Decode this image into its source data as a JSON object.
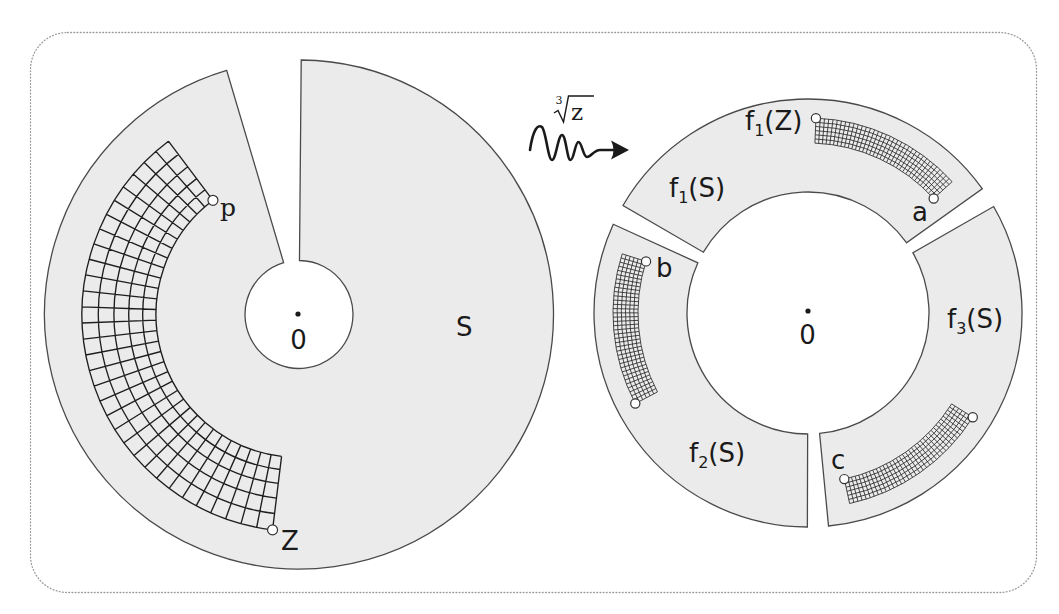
{
  "figure": {
    "mapping_label": {
      "index": "3",
      "radicand": "z"
    },
    "domain": {
      "region_label": "S",
      "origin_label": "0",
      "point_labels": {
        "p": "p",
        "Z": "Z"
      }
    },
    "image": {
      "origin_label": "0",
      "sector_labels": [
        {
          "base": "f",
          "sub": "1",
          "arg": "(S)"
        },
        {
          "base": "f",
          "sub": "2",
          "arg": "(S)"
        },
        {
          "base": "f",
          "sub": "3",
          "arg": "(S)"
        }
      ],
      "f1Z_label": {
        "base": "f",
        "sub": "1",
        "arg": "(Z)"
      },
      "point_labels": {
        "a": "a",
        "b": "b",
        "c": "c"
      }
    }
  },
  "colors": {
    "region_fill": "#ebebeb",
    "region_stroke": "#4a4a4a",
    "grid_stroke": "#1e1e1e",
    "frame_stroke": "#9a9a9a",
    "marker_fill": "#ffffff"
  },
  "diagram": {
    "domain": {
      "center": [
        299,
        314.5
      ],
      "r_outer": 254.5,
      "r_inner": 54,
      "arc_from_deg": 106.5,
      "arc_to_deg": 449.5,
      "grid": {
        "r_inner": 143,
        "r_outer": 217,
        "deg_from": 127,
        "deg_to": 263,
        "radial_cells": 5,
        "angular_cells": 32,
        "radial_spacing": "cubic"
      }
    },
    "image": {
      "center": [
        808,
        313
      ],
      "r_outer": 214,
      "r_inner": 121,
      "branches": [
        {
          "name": "f1",
          "rotation_deg": 0
        },
        {
          "name": "f2",
          "rotation_deg": 120
        },
        {
          "name": "f3",
          "rotation_deg": 240
        }
      ],
      "grid": {
        "r_inner": 170,
        "r_outer": 195,
        "radial_cells": 6,
        "angular_cells": 36
      }
    }
  }
}
